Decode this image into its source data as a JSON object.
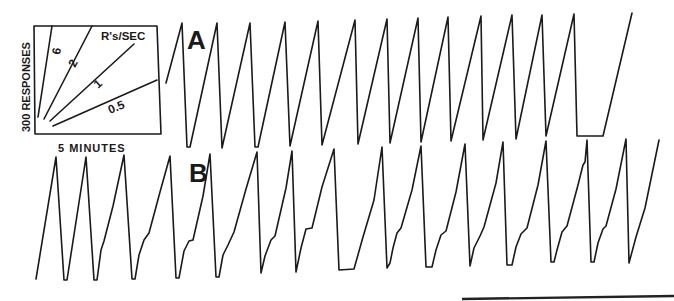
{
  "figure": {
    "type": "cumulative-record",
    "panels": [
      "A",
      "B"
    ],
    "inset": {
      "y_label": "300 RESPONSES",
      "x_label": "5 MINUTES",
      "rate_label": "R's/SEC",
      "rate_lines": [
        {
          "label": "6",
          "x1": 38,
          "y1": 117,
          "x2": 52,
          "y2": 26,
          "lx": 60,
          "ly": 55,
          "rot": -80
        },
        {
          "label": "2",
          "x1": 44,
          "y1": 119,
          "x2": 92,
          "y2": 26,
          "lx": 75,
          "ly": 68,
          "rot": -62
        },
        {
          "label": "1",
          "x1": 50,
          "y1": 121,
          "x2": 134,
          "y2": 44,
          "lx": 98,
          "ly": 89,
          "rot": -42
        },
        {
          "label": "0.5",
          "x1": 53,
          "y1": 126,
          "x2": 157,
          "y2": 80,
          "lx": 110,
          "ly": 114,
          "rot": -22
        }
      ]
    },
    "record_A": {
      "label": "A",
      "points": [
        [
          166,
          83
        ],
        [
          182,
          23
        ],
        [
          187,
          147
        ],
        [
          190,
          147
        ],
        [
          217,
          23
        ],
        [
          222,
          148
        ],
        [
          250,
          23
        ],
        [
          255,
          147
        ],
        [
          258,
          147
        ],
        [
          285,
          22
        ],
        [
          290,
          146
        ],
        [
          318,
          21
        ],
        [
          322,
          145
        ],
        [
          355,
          20
        ],
        [
          358,
          144
        ],
        [
          387,
          19
        ],
        [
          390,
          143
        ],
        [
          418,
          18
        ],
        [
          421,
          142
        ],
        [
          448,
          17
        ],
        [
          451,
          141
        ],
        [
          481,
          16
        ],
        [
          483,
          140
        ],
        [
          512,
          15
        ],
        [
          516,
          139
        ],
        [
          542,
          15
        ],
        [
          546,
          136
        ],
        [
          574,
          14
        ],
        [
          577,
          136
        ],
        [
          603,
          136
        ],
        [
          632,
          13
        ]
      ]
    },
    "record_B": {
      "label": "B",
      "points": [
        [
          36,
          279
        ],
        [
          56,
          157
        ],
        [
          64,
          280
        ],
        [
          67,
          280
        ],
        [
          86,
          157
        ],
        [
          94,
          280
        ],
        [
          97,
          280
        ],
        [
          101,
          250
        ],
        [
          104,
          241
        ],
        [
          113,
          206
        ],
        [
          124,
          155
        ],
        [
          132,
          279
        ],
        [
          135,
          279
        ],
        [
          139,
          255
        ],
        [
          144,
          240
        ],
        [
          149,
          233
        ],
        [
          160,
          192
        ],
        [
          170,
          156
        ],
        [
          176,
          278
        ],
        [
          179,
          278
        ],
        [
          184,
          251
        ],
        [
          189,
          241
        ],
        [
          193,
          240
        ],
        [
          203,
          196
        ],
        [
          210,
          154
        ],
        [
          216,
          277
        ],
        [
          219,
          277
        ],
        [
          223,
          255
        ],
        [
          228,
          245
        ],
        [
          234,
          232
        ],
        [
          246,
          189
        ],
        [
          257,
          152
        ],
        [
          261,
          273
        ],
        [
          265,
          256
        ],
        [
          271,
          240
        ],
        [
          275,
          236
        ],
        [
          286,
          188
        ],
        [
          292,
          151
        ],
        [
          296,
          272
        ],
        [
          301,
          248
        ],
        [
          306,
          229
        ],
        [
          312,
          228
        ],
        [
          322,
          187
        ],
        [
          334,
          149
        ],
        [
          339,
          270
        ],
        [
          354,
          269
        ],
        [
          363,
          237
        ],
        [
          374,
          200
        ],
        [
          382,
          147
        ],
        [
          387,
          268
        ],
        [
          390,
          263
        ],
        [
          393,
          248
        ],
        [
          397,
          233
        ],
        [
          401,
          228
        ],
        [
          412,
          190
        ],
        [
          421,
          146
        ],
        [
          426,
          267
        ],
        [
          432,
          267
        ],
        [
          436,
          250
        ],
        [
          441,
          235
        ],
        [
          446,
          231
        ],
        [
          456,
          192
        ],
        [
          465,
          144
        ],
        [
          470,
          266
        ],
        [
          474,
          248
        ],
        [
          480,
          236
        ],
        [
          484,
          227
        ],
        [
          496,
          183
        ],
        [
          503,
          142
        ],
        [
          507,
          265
        ],
        [
          512,
          265
        ],
        [
          516,
          247
        ],
        [
          521,
          234
        ],
        [
          527,
          228
        ],
        [
          538,
          185
        ],
        [
          546,
          141
        ],
        [
          551,
          262
        ],
        [
          554,
          262
        ],
        [
          557,
          250
        ],
        [
          562,
          232
        ],
        [
          567,
          226
        ],
        [
          578,
          185
        ],
        [
          583,
          165
        ],
        [
          585,
          162
        ],
        [
          587,
          140
        ],
        [
          591,
          262
        ],
        [
          594,
          262
        ],
        [
          598,
          243
        ],
        [
          603,
          229
        ],
        [
          606,
          226
        ],
        [
          616,
          189
        ],
        [
          626,
          139
        ],
        [
          629,
          263
        ],
        [
          636,
          237
        ],
        [
          645,
          208
        ],
        [
          659,
          140
        ]
      ]
    },
    "scan_edge": {
      "x1": 462,
      "y1": 299,
      "x2": 674,
      "y2": 296
    }
  }
}
